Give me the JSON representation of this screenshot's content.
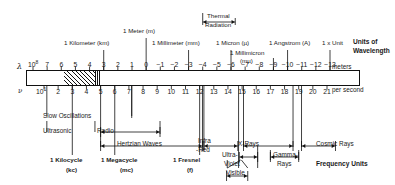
{
  "figure": {
    "title_right_top": "Units of\nWavelength",
    "units_of_wavelength_line1": "Units of",
    "units_of_wavelength_line2": "Wavelength",
    "frequency_units": "Frequency Units",
    "meters_label": "meters",
    "per_second_label": "per second",
    "lambda_symbol": "λ",
    "nu_symbol": "ν",
    "wavelength_base": "10",
    "wavelength_base_exp": "8",
    "frequency_base": "10",
    "frequency_base_exp": "1"
  },
  "wavelength_axis": {
    "name": "wavelength-exponent-scale",
    "unit": "meters",
    "exponents": [
      8,
      7,
      6,
      5,
      4,
      3,
      2,
      1,
      0,
      -1,
      -2,
      -3,
      -4,
      -5,
      -6,
      -7,
      -8,
      -9,
      -10,
      -11,
      -12,
      -13
    ],
    "tick_labels": [
      "8",
      "7",
      "6",
      "5",
      "4",
      "3",
      "2",
      "1",
      "0",
      "−1",
      "−2",
      "−3",
      "−4",
      "−5",
      "−6",
      "−7",
      "−8",
      "−9",
      "−10",
      "−11",
      "−12",
      "−13"
    ]
  },
  "frequency_axis": {
    "name": "frequency-exponent-scale",
    "unit": "per second",
    "exponents": [
      1,
      2,
      3,
      4,
      5,
      6,
      7,
      8,
      9,
      10,
      11,
      12,
      13,
      14,
      15,
      16,
      17,
      18,
      19,
      20,
      21
    ],
    "tick_labels": [
      "1",
      "2",
      "3",
      "4",
      "5",
      "6",
      "7",
      "8",
      "9",
      "10",
      "11",
      "12",
      "13",
      "14",
      "15",
      "16",
      "17",
      "18",
      "19",
      "20",
      "21"
    ]
  },
  "wavelength_markers": [
    {
      "name": "marker-kilometer",
      "label": "1 Kilometer (km)",
      "exponent": 3
    },
    {
      "name": "marker-meter",
      "label": "1 Meter (m)",
      "exponent": 0
    },
    {
      "name": "marker-millimeter",
      "label": "1 Millimeter (mm)",
      "exponent": -3
    },
    {
      "name": "marker-micron",
      "label": "1 Micron (µ)",
      "exponent": -6
    },
    {
      "name": "marker-millimicron",
      "label": "1 Millimicron",
      "label2": "(mµ)",
      "exponent": -9
    },
    {
      "name": "marker-angstrom",
      "label": "1 Angstrom (A)",
      "exponent": -10
    },
    {
      "name": "marker-x-unit",
      "label": "1 x Unit",
      "exponent": -13
    }
  ],
  "thermal_radiation": {
    "name": "thermal-radiation-bracket",
    "line1": "Thermal",
    "line2": "Radiation",
    "from_exponent": -4,
    "to_exponent": -6.3
  },
  "frequency_markers": [
    {
      "name": "marker-kilocycle",
      "line1": "1 Kilocycle",
      "line2": "(kc)",
      "exponent": 3
    },
    {
      "name": "marker-megacycle",
      "line1": "1 Megacycle",
      "line2": "(mc)",
      "exponent": 6
    },
    {
      "name": "marker-fresnel",
      "line1": "1 Fresnel",
      "line2": "(f)",
      "exponent": 12
    }
  ],
  "bands": [
    {
      "name": "band-slow-oscillations",
      "label": "Slow Oscillations",
      "style": "plain",
      "from": 1.2,
      "to": 7.2,
      "row": 0
    },
    {
      "name": "band-ultrasonic",
      "label": "Ultrasonic",
      "style": "plain",
      "from": 1.2,
      "to": 4.6,
      "row": 1
    },
    {
      "name": "band-radio",
      "label": "Radio",
      "style": "arrows",
      "from": 5.0,
      "to": 9.2,
      "row": 1
    },
    {
      "name": "band-hertzian-waves",
      "label": "Hertzian Waves",
      "style": "arrows",
      "from": 5.0,
      "to": 12.2,
      "row": 2
    },
    {
      "name": "band-infra-red",
      "label": "Infra",
      "label2": "-Red",
      "style": "arrows",
      "from": 12.3,
      "to": 14.7,
      "row": 2
    },
    {
      "name": "band-x-rays",
      "label": "X-Rays",
      "style": "arrows",
      "from": 15.1,
      "to": 18.6,
      "row": 2
    },
    {
      "name": "band-cosmic-rays",
      "label": "Cosmic Rays",
      "style": "arrows",
      "from": 19.2,
      "to": 21.6,
      "row": 2
    },
    {
      "name": "band-ultra-violet",
      "label": "Ultra-",
      "label2": "Violet",
      "style": "arrows",
      "from": 14.8,
      "to": 16.1,
      "row": 3
    },
    {
      "name": "band-gamma-rays",
      "label": "Gamma-",
      "label2": "Rays",
      "style": "arrows",
      "from": 17.0,
      "to": 19.0,
      "row": 3
    },
    {
      "name": "band-visible",
      "label": "Visible",
      "style": "arrows",
      "from": 13.9,
      "to": 15.4,
      "row": 4
    }
  ]
}
